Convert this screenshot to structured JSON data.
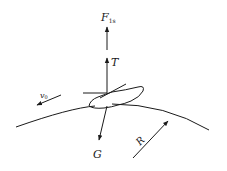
{
  "diagram": {
    "type": "force-diagram",
    "labels": {
      "lift_force": "F",
      "lift_force_subscript": "1s",
      "tension_or_thrust": "T",
      "velocity": "v",
      "velocity_subscript": "0",
      "gravity": "G",
      "radius": "R"
    },
    "colors": {
      "stroke": "#1a1a1a",
      "background": "#ffffff"
    }
  }
}
